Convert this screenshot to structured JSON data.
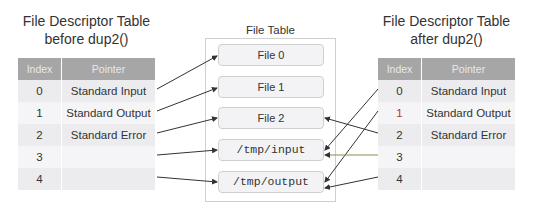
{
  "left_table": {
    "title_line1": "File Descriptor Table",
    "title_line2": "before dup2()",
    "headers": {
      "index": "Index",
      "pointer": "Pointer"
    },
    "rows": [
      {
        "index": "0",
        "pointer": "Standard Input"
      },
      {
        "index": "1",
        "pointer": "Standard Output"
      },
      {
        "index": "2",
        "pointer": "Standard Error"
      },
      {
        "index": "3",
        "pointer": ""
      },
      {
        "index": "4",
        "pointer": ""
      }
    ]
  },
  "file_table": {
    "title": "File Table",
    "entries": [
      "File 0",
      "File 1",
      "File 2",
      "/tmp/input",
      "/tmp/output"
    ]
  },
  "right_table": {
    "title_line1": "File Descriptor Table",
    "title_line2": "after dup2()",
    "headers": {
      "index": "Index",
      "pointer": "Pointer"
    },
    "rows": [
      {
        "index": "0",
        "pointer": "Standard Input"
      },
      {
        "index": "1",
        "pointer": "Standard Output"
      },
      {
        "index": "2",
        "pointer": "Standard Error"
      },
      {
        "index": "3",
        "pointer": ""
      },
      {
        "index": "4",
        "pointer": ""
      }
    ]
  },
  "arrows": {
    "before": [
      {
        "from_fd": "0",
        "to": "File 0"
      },
      {
        "from_fd": "1",
        "to": "File 1"
      },
      {
        "from_fd": "2",
        "to": "File 2"
      },
      {
        "from_fd": "3",
        "to": "/tmp/input"
      },
      {
        "from_fd": "4",
        "to": "/tmp/output"
      }
    ],
    "after": [
      {
        "from_fd": "0",
        "to": "/tmp/input"
      },
      {
        "from_fd": "1",
        "to": "/tmp/output"
      },
      {
        "from_fd": "2",
        "to": "File 2"
      },
      {
        "from_fd": "3",
        "to": "/tmp/input"
      },
      {
        "from_fd": "4",
        "to": "/tmp/output"
      }
    ]
  },
  "colors": {
    "header_bg": "#a6a6a6",
    "row_bg": "#ececef",
    "arrow": "#333333",
    "arrow_fd3_after": "#8a8a50",
    "fd1_after_index": "#c03030"
  }
}
